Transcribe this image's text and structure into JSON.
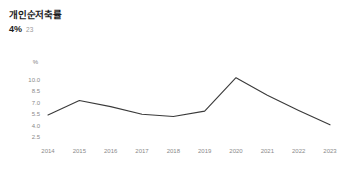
{
  "header": {
    "title": "개인순저축률",
    "metric_value": "4%",
    "metric_period": "23"
  },
  "chart_data": {
    "type": "line",
    "title": "개인순저축률",
    "xlabel": "",
    "ylabel": "%",
    "unit_label": "%",
    "categories": [
      "2014",
      "2015",
      "2016",
      "2017",
      "2018",
      "2019",
      "2020",
      "2021",
      "2022",
      "2023"
    ],
    "values": [
      5.4,
      7.3,
      6.5,
      5.5,
      5.2,
      5.9,
      10.3,
      8.0,
      6.0,
      4.1
    ],
    "series": [
      {
        "name": "개인순저축률",
        "values": [
          5.4,
          7.3,
          6.5,
          5.5,
          5.2,
          5.9,
          10.3,
          8.0,
          6.0,
          4.1
        ],
        "color": "#3a3a3a"
      }
    ],
    "ylim": [
      2.5,
      10.0
    ],
    "yticks": [
      10.0,
      8.5,
      7.0,
      5.5,
      4.0,
      2.5
    ],
    "ytick_labels": [
      "10.0",
      "8.5",
      "7.0",
      "5.5",
      "4.0",
      "2.5"
    ],
    "xtick_labels": [
      "2014",
      "2015",
      "2016",
      "2017",
      "2018",
      "2019",
      "2020",
      "2021",
      "2022",
      "2023"
    ],
    "grid": false,
    "legend": "none",
    "line_color": "#3a3a3a",
    "axis_text_color": "#8a8a8a"
  }
}
